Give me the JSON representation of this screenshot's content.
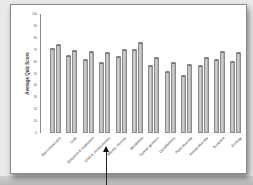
{
  "chart_data": {
    "type": "bar",
    "title": "",
    "xlabel": "",
    "ylabel": "Average Quiz Score",
    "ylim": [
      0,
      100
    ],
    "yticks": [
      0,
      10,
      20,
      30,
      40,
      50,
      60,
      70,
      80,
      90,
      100
    ],
    "grid": false,
    "legend": null,
    "categories": [
      "Macromolecules",
      "Cells",
      "Enzymes & respiration",
      "DNA & chromosomes",
      "Mitosis, meiosis",
      "Mendelism",
      "Human genetics",
      "Cytoplasmics",
      "Plant diversity",
      "Animal diversity",
      "Evolution",
      "Ecology"
    ],
    "series": [
      {
        "name": "Series 1",
        "values": [
          71,
          65,
          61,
          59,
          64,
          70,
          56,
          51,
          48,
          56,
          61,
          60
        ]
      },
      {
        "name": "Series 2",
        "values": [
          74,
          69,
          68,
          67,
          70,
          76,
          63,
          59,
          57,
          63,
          68,
          67
        ]
      }
    ]
  },
  "annotation": {
    "type": "arrow",
    "target": "Mitosis, meiosis"
  }
}
